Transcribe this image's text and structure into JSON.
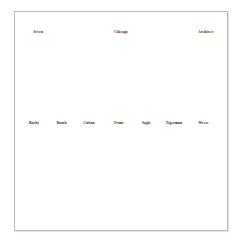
{
  "page": {
    "background_color": "#ffffff",
    "panel_border_color": "#b9b9b9",
    "panel_background_color": "#ffffff",
    "text_color": "#1b1b1b"
  },
  "panel": {
    "rows": [
      {
        "name": "top-row",
        "labels": [
          {
            "text": "Seven",
            "x_percent": 11
          },
          {
            "text": "Chicago",
            "x_percent": 50
          },
          {
            "text": "Architect",
            "x_percent": 90
          }
        ]
      },
      {
        "name": "middle-row",
        "labels": [
          {
            "text": "Bushy",
            "x_percent": 9
          },
          {
            "text": "Booth",
            "x_percent": 22
          },
          {
            "text": "Cuban",
            "x_percent": 35
          },
          {
            "text": "Front",
            "x_percent": 49
          },
          {
            "text": "Sagle",
            "x_percent": 62
          },
          {
            "text": "Tigerman",
            "x_percent": 75
          },
          {
            "text": "Weese",
            "x_percent": 89
          }
        ]
      }
    ]
  }
}
